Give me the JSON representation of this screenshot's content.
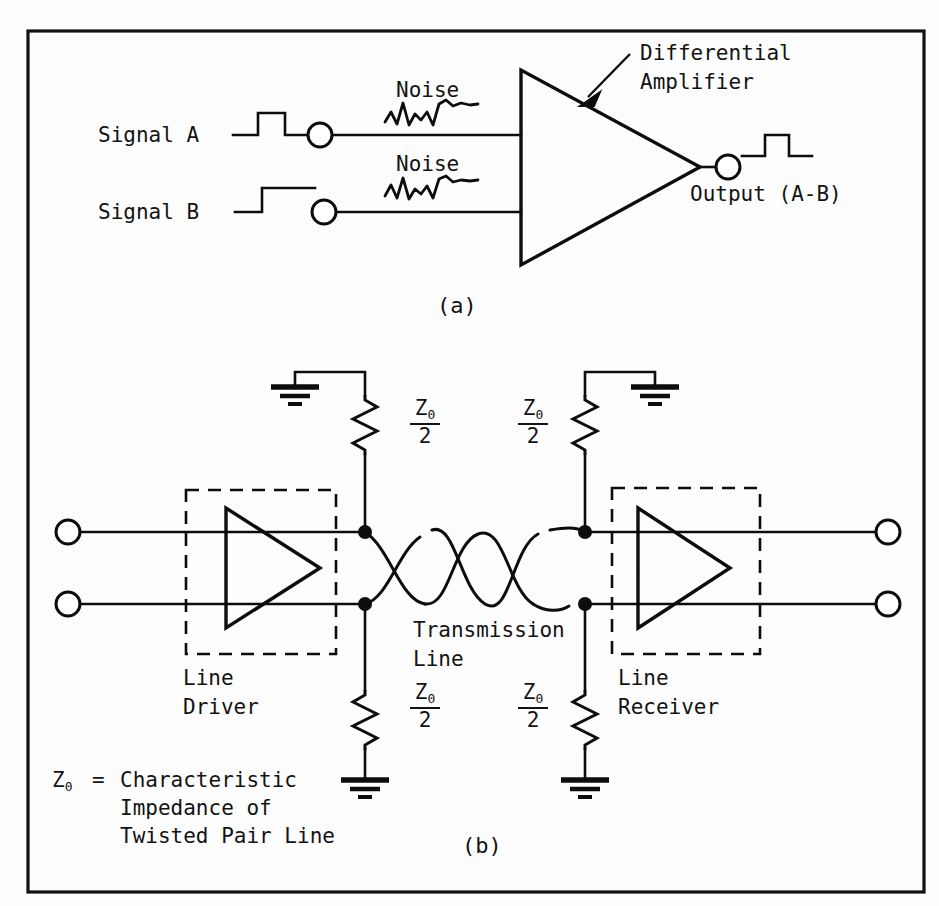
{
  "figure": {
    "ink_color": "#0d0d0d",
    "background_color": "#fdfdfd",
    "panels": [
      {
        "id": "a",
        "caption": "(a)"
      },
      {
        "id": "b",
        "caption": "(b)"
      }
    ]
  },
  "panel_a": {
    "caption": "(a)",
    "signal_a_label": "Signal A",
    "signal_b_label": "Signal B",
    "noise_label_top": "Noise",
    "noise_label_bottom": "Noise",
    "amplifier_label_line1": "Differential",
    "amplifier_label_line2": "Amplifier",
    "output_label": "Output (A-B)",
    "waveforms": {
      "signal_a": "pulse",
      "signal_b": "step",
      "output": "pulse",
      "noise": "random-squiggle"
    },
    "terminals": 3,
    "amplifier_shape": "triangle-right"
  },
  "panel_b": {
    "caption": "(b)",
    "line_driver_label_line1": "Line",
    "line_driver_label_line2": "Driver",
    "line_receiver_label_line1": "Line",
    "line_receiver_label_line2": "Receiver",
    "transmission_line_label_line1": "Transmission",
    "transmission_line_label_line2": "Line",
    "resistors": [
      {
        "position": "driver-top",
        "numerator": "Z",
        "subscript": "0",
        "denominator": "2",
        "label": "Z0/2"
      },
      {
        "position": "driver-bottom",
        "numerator": "Z",
        "subscript": "0",
        "denominator": "2",
        "label": "Z0/2"
      },
      {
        "position": "receiver-top",
        "numerator": "Z",
        "subscript": "0",
        "denominator": "2",
        "label": "Z0/2"
      },
      {
        "position": "receiver-bottom",
        "numerator": "Z",
        "subscript": "0",
        "denominator": "2",
        "label": "Z0/2"
      }
    ],
    "legend": {
      "symbol": "Z",
      "subscript": "0",
      "equals": "=",
      "line1": "Characteristic",
      "line2": "Impedance of",
      "line3": "Twisted Pair Line",
      "full_text": "Z0 = Characteristic Impedance of Twisted Pair Line"
    },
    "ground_symbols": 4,
    "terminals": 4,
    "junction_dots": 4
  }
}
